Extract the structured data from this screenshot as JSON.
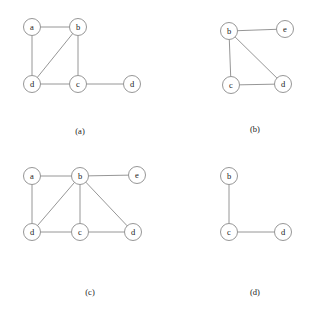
{
  "figure": {
    "width": 309,
    "height": 325,
    "background_color": "#ffffff",
    "stroke_color": "#8a8a8a",
    "node_fill_color": "#ffffff",
    "text_color": "#1a1a1a",
    "node_radius": 8.5
  },
  "subfigures": [
    {
      "id": "a",
      "caption": "(a)",
      "caption_x": 80,
      "caption_y": 131,
      "nodes": [
        {
          "id": "a1",
          "label": "a",
          "x": 32,
          "y": 27
        },
        {
          "id": "b1",
          "label": "b",
          "x": 78,
          "y": 27
        },
        {
          "id": "d1",
          "label": "d",
          "x": 32,
          "y": 84
        },
        {
          "id": "c1",
          "label": "c",
          "x": 78,
          "y": 84
        },
        {
          "id": "d2",
          "label": "d",
          "x": 132,
          "y": 84
        }
      ],
      "edges": [
        {
          "from": "a1",
          "to": "b1"
        },
        {
          "from": "a1",
          "to": "d1"
        },
        {
          "from": "b1",
          "to": "d1"
        },
        {
          "from": "b1",
          "to": "c1"
        },
        {
          "from": "d1",
          "to": "c1"
        },
        {
          "from": "c1",
          "to": "d2"
        }
      ]
    },
    {
      "id": "b",
      "caption": "(b)",
      "caption_x": 255,
      "caption_y": 129,
      "nodes": [
        {
          "id": "b1",
          "label": "b",
          "x": 229,
          "y": 31
        },
        {
          "id": "e1",
          "label": "e",
          "x": 285,
          "y": 29
        },
        {
          "id": "c1",
          "label": "c",
          "x": 231,
          "y": 85
        },
        {
          "id": "d1",
          "label": "d",
          "x": 283,
          "y": 84
        }
      ],
      "edges": [
        {
          "from": "b1",
          "to": "e1"
        },
        {
          "from": "b1",
          "to": "c1"
        },
        {
          "from": "b1",
          "to": "d1"
        },
        {
          "from": "c1",
          "to": "d1"
        }
      ]
    },
    {
      "id": "c",
      "caption": "(c)",
      "caption_x": 90,
      "caption_y": 292,
      "nodes": [
        {
          "id": "a1",
          "label": "a",
          "x": 32,
          "y": 176
        },
        {
          "id": "b1",
          "label": "b",
          "x": 80,
          "y": 176
        },
        {
          "id": "e1",
          "label": "e",
          "x": 137,
          "y": 175
        },
        {
          "id": "d1",
          "label": "d",
          "x": 32,
          "y": 232
        },
        {
          "id": "c1",
          "label": "c",
          "x": 80,
          "y": 232
        },
        {
          "id": "d2",
          "label": "d",
          "x": 133,
          "y": 232
        }
      ],
      "edges": [
        {
          "from": "a1",
          "to": "b1"
        },
        {
          "from": "b1",
          "to": "e1"
        },
        {
          "from": "a1",
          "to": "d1"
        },
        {
          "from": "b1",
          "to": "d1"
        },
        {
          "from": "b1",
          "to": "c1"
        },
        {
          "from": "b1",
          "to": "d2"
        },
        {
          "from": "d1",
          "to": "c1"
        },
        {
          "from": "c1",
          "to": "d2"
        }
      ]
    },
    {
      "id": "d",
      "caption": "(d)",
      "caption_x": 255,
      "caption_y": 292,
      "nodes": [
        {
          "id": "b1",
          "label": "b",
          "x": 229,
          "y": 176
        },
        {
          "id": "c1",
          "label": "c",
          "x": 229,
          "y": 232
        },
        {
          "id": "d1",
          "label": "d",
          "x": 283,
          "y": 232
        }
      ],
      "edges": [
        {
          "from": "b1",
          "to": "c1"
        },
        {
          "from": "c1",
          "to": "d1"
        }
      ]
    }
  ]
}
